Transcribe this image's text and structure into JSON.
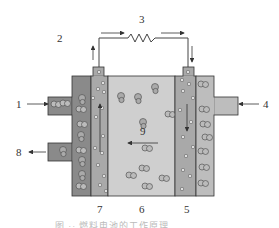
{
  "figure": {
    "type": "schematic diagram of a cell with two electrodes and external circuit",
    "caption": "图 ·· 燃料电池的工作原理",
    "labels": {
      "l1": "1",
      "l2": "2",
      "l3": "3",
      "l4": "4",
      "l5": "5",
      "l6": "6",
      "l7": "7",
      "l8": "8",
      "l9": "9"
    },
    "components": [
      {
        "id": "1",
        "role": "left inlet"
      },
      {
        "id": "2",
        "role": "electron flow out of left electrode"
      },
      {
        "id": "3",
        "role": "external load (resistor)"
      },
      {
        "id": "4",
        "role": "right inlet"
      },
      {
        "id": "5",
        "role": "right electrode"
      },
      {
        "id": "6",
        "role": "electrolyte"
      },
      {
        "id": "7",
        "role": "left electrode"
      },
      {
        "id": "8",
        "role": "left outlet"
      },
      {
        "id": "9",
        "role": "ion flow through electrolyte (right to left)"
      }
    ],
    "colors": {
      "outer_chamber_left": "#8a8a8a",
      "electrode": "#a9a9a9",
      "electrolyte": "#cfcfcf",
      "outer_chamber_right": "#bdbdbd",
      "line": "#333333"
    }
  }
}
